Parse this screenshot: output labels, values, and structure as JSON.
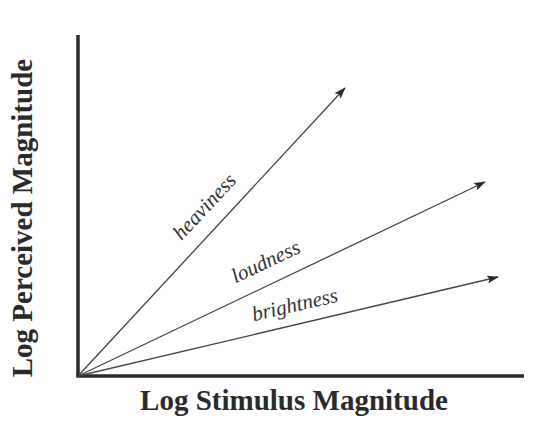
{
  "diagram": {
    "title": "",
    "x_axis": {
      "label": "Log Stimulus Magnitude",
      "origin": [
        78,
        376
      ],
      "end": [
        524,
        376
      ]
    },
    "y_axis": {
      "label": "Log Perceived Magnitude",
      "origin": [
        78,
        376
      ],
      "end": [
        78,
        35
      ]
    },
    "colors": {
      "axis": "#2a2a2a",
      "line": "#444444",
      "text": "#2a2a2a"
    },
    "lines": [
      {
        "label": "heaviness",
        "start": [
          78,
          376
        ],
        "end": [
          345,
          88
        ],
        "relation": "steepest slope (exponent > 1)"
      },
      {
        "label": "loudness",
        "start": [
          78,
          376
        ],
        "end": [
          485,
          182
        ],
        "relation": "intermediate slope"
      },
      {
        "label": "brightness",
        "start": [
          78,
          376
        ],
        "end": [
          498,
          277
        ],
        "relation": "shallowest slope"
      }
    ]
  },
  "chart_data": {
    "type": "line",
    "title": "",
    "xlabel": "Log Stimulus Magnitude",
    "ylabel": "Log Perceived Magnitude",
    "grid": false,
    "legend": "inline labels on lines",
    "x_ticks": [],
    "y_ticks": [],
    "series": [
      {
        "name": "heaviness",
        "x": [
          0,
          0.6
        ],
        "y": [
          0,
          0.85
        ],
        "slope_approx": 1.43
      },
      {
        "name": "loudness",
        "x": [
          0,
          0.91
        ],
        "y": [
          0,
          0.57
        ],
        "slope_approx": 0.63
      },
      {
        "name": "brightness",
        "x": [
          0,
          0.94
        ],
        "y": [
          0,
          0.29
        ],
        "slope_approx": 0.31
      }
    ]
  }
}
